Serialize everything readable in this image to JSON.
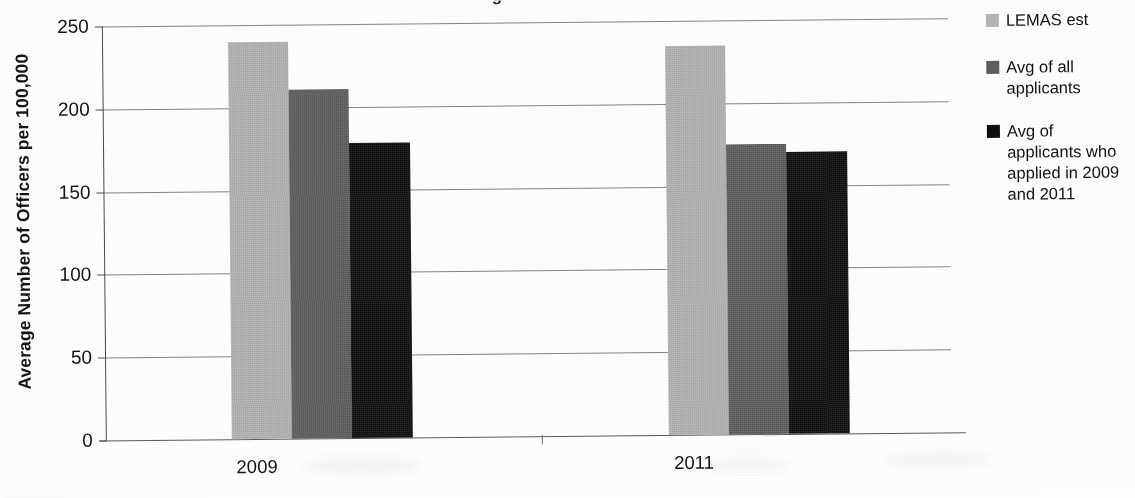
{
  "chart_data": {
    "type": "bar",
    "title": "",
    "xlabel": "",
    "ylabel": "Average Number of Officers per 100,000",
    "categories": [
      "2009",
      "2011"
    ],
    "series": [
      {
        "name": "LEMAS est",
        "color": "#b4b4b4",
        "values": [
          240,
          235
        ]
      },
      {
        "name": "Avg of all applicants",
        "color": "#5e5e5e",
        "values": [
          211,
          175
        ]
      },
      {
        "name": "Avg of applicants who applied in 2009 and 2011",
        "color": "#0e0e0e",
        "values": [
          178,
          170
        ]
      }
    ],
    "ylim": [
      0,
      250
    ],
    "yticks": [
      0,
      50,
      100,
      150,
      200,
      250
    ],
    "ytick_labels": [
      "0",
      "50",
      "100",
      "150",
      "200",
      "250"
    ],
    "grid": true,
    "legend_position": "right"
  },
  "axis": {
    "y_title": "Average Number of Officers per 100,000",
    "tick_labels": [
      "250",
      "200",
      "150",
      "100",
      "50",
      "0"
    ],
    "category_labels": [
      "2009",
      "2011"
    ]
  },
  "legend": {
    "items": [
      {
        "label": "LEMAS est",
        "color": "#b4b4b4"
      },
      {
        "label": "Avg of all applicants",
        "color": "#5e5e5e"
      },
      {
        "label": "Avg of applicants who applied in 2009 and 2011",
        "color": "#0e0e0e"
      }
    ]
  },
  "artifacts": {
    "cropped_title_fragment": "g"
  }
}
